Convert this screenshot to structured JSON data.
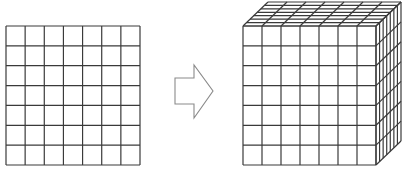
{
  "diagram": {
    "colors": {
      "line": "#3a3a3a",
      "arrow": "#8a8a8a",
      "background": "#ffffff"
    },
    "square_grid": {
      "rows": 7,
      "cols": 7,
      "x": 6,
      "y": 26,
      "width": 134,
      "height": 139
    },
    "arrow": {
      "direction": "right",
      "points": "175,78 194,78 194,65 213,91 194,118 194,104 175,104"
    },
    "cube": {
      "divisions": 7,
      "front": {
        "x": 243,
        "y": 26,
        "width": 133,
        "height": 139
      },
      "depth": {
        "dx": 25,
        "dy": -24
      }
    }
  }
}
